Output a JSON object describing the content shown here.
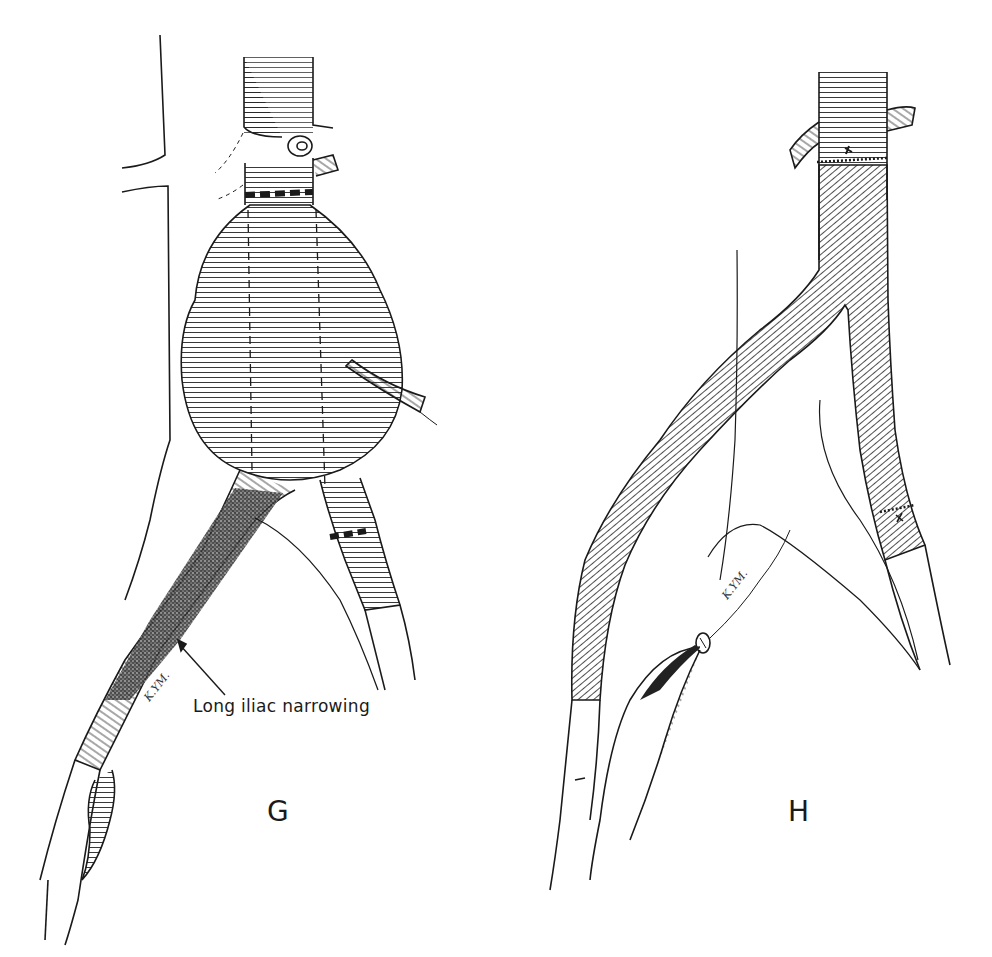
{
  "figure": {
    "type": "surgical illustration (line drawing)",
    "panels": [
      {
        "id": "G",
        "letter": "G",
        "annotation": "Long iliac narrowing",
        "artist_mark": "K.YM.",
        "contents": [
          "aortic aneurysm sac with dashed incision lines",
          "proximal aortic clamp band",
          "transected aorta stump with ligated branch",
          "inferior mesenteric artery stub",
          "stenotic left common iliac artery (shaded)",
          "right common iliac artery with dashed band"
        ]
      },
      {
        "id": "H",
        "letter": "H",
        "artist_mark": "K.YM.",
        "contents": [
          "aortic graft with proximal suture line",
          "bifurcated graft limbs",
          "distal right limb anastomosis",
          "left limb end-to-side anastomosis to femoral artery",
          "ligated iliac stump"
        ]
      }
    ],
    "caption_partial": "(caption text cut off at bottom edge)"
  },
  "colors": {
    "ink": "#1a1a1a",
    "background": "#ffffff"
  }
}
